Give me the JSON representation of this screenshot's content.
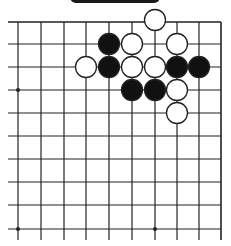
{
  "diagram": {
    "type": "go-board-fragment",
    "grid": {
      "columns_x": [
        18,
        41,
        64,
        86,
        109,
        132,
        155,
        177,
        199,
        221
      ],
      "rows_y": [
        22,
        44,
        67,
        90,
        113,
        136,
        159,
        182,
        205,
        229
      ],
      "edges": {
        "top": true,
        "right": true,
        "left": false,
        "bottom": false
      },
      "line_color": "#222222"
    },
    "star_points": [
      {
        "col": 0,
        "row": 3
      },
      {
        "col": 0,
        "row": 9
      },
      {
        "col": 6,
        "row": 9
      }
    ],
    "stones": [
      {
        "color": "white",
        "col": 6,
        "row": 0
      },
      {
        "color": "black",
        "col": 4,
        "row": 1
      },
      {
        "color": "white",
        "col": 5,
        "row": 1
      },
      {
        "color": "white",
        "col": 7,
        "row": 1
      },
      {
        "color": "white",
        "col": 3,
        "row": 2
      },
      {
        "color": "black",
        "col": 4,
        "row": 2
      },
      {
        "color": "white",
        "col": 5,
        "row": 2
      },
      {
        "color": "white",
        "col": 6,
        "row": 2
      },
      {
        "color": "black",
        "col": 7,
        "row": 2
      },
      {
        "color": "black",
        "col": 8,
        "row": 2
      },
      {
        "color": "black",
        "col": 5,
        "row": 3
      },
      {
        "color": "black",
        "col": 6,
        "row": 3
      },
      {
        "color": "white",
        "col": 7,
        "row": 3
      },
      {
        "color": "white",
        "col": 7,
        "row": 4
      }
    ],
    "colors": {
      "black_stone": "#111111",
      "white_stone": "#ffffff",
      "stone_outline": "#222222"
    }
  }
}
